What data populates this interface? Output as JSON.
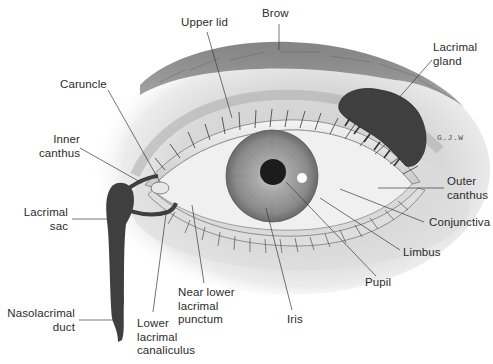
{
  "figure": {
    "signature": "G.J.W",
    "colors": {
      "background": "#ffffff",
      "skin_shade": "#bdbdbd",
      "brow": "#6e6e6e",
      "lacrimal_structures": "#3f3f3f",
      "iris": "#8a8a8a",
      "pupil": "#1c1c1c",
      "sclera": "#f2f2f2",
      "text": "#2b2b2b",
      "leader_line": "#3a3a3a"
    }
  },
  "labels": {
    "brow": "Brow",
    "upper_lid": "Upper lid",
    "lacrimal_gland": "Lacrimal\ngland",
    "caruncle": "Caruncle",
    "inner_canthus": "Inner\ncanthus",
    "outer_canthus": "Outer\ncanthus",
    "conjunctiva": "Conjunctiva",
    "limbus": "Limbus",
    "pupil": "Pupil",
    "iris": "Iris",
    "lacrimal_sac": "Lacrimal\nsac",
    "nasolacrimal_duct": "Nasolacrimal\nduct",
    "near_lower_lacrimal_punctum": "Near lower\nlacrimal\npunctum",
    "lower_lacrimal_canaliculus": "Lower\nlacrimal\ncanaliculus"
  }
}
